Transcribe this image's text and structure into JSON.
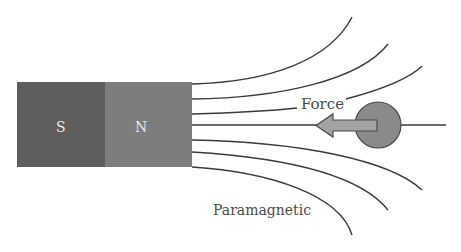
{
  "diagram": {
    "magnet": {
      "south_label": "S",
      "north_label": "N",
      "south_color": "#5e5e5e",
      "north_color": "#7d7d7d"
    },
    "force_label": "Force",
    "material_label": "Paramagnetic",
    "particle_color": "#8a8a8a",
    "arrow_color": "#999999",
    "line_color": "#3a3a3a"
  }
}
